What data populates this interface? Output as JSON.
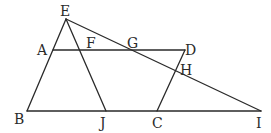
{
  "diagram": {
    "type": "geometry",
    "points": [
      {
        "id": "E",
        "label": "E"
      },
      {
        "id": "A",
        "label": "A"
      },
      {
        "id": "F",
        "label": "F"
      },
      {
        "id": "G",
        "label": "G"
      },
      {
        "id": "D",
        "label": "D"
      },
      {
        "id": "H",
        "label": "H"
      },
      {
        "id": "B",
        "label": "B"
      },
      {
        "id": "J",
        "label": "J"
      },
      {
        "id": "C",
        "label": "C"
      },
      {
        "id": "I",
        "label": "I"
      }
    ],
    "segments": [
      {
        "id": "EB",
        "from": "E",
        "to": "B"
      },
      {
        "id": "EJ",
        "from": "E",
        "to": "J"
      },
      {
        "id": "EI",
        "from": "E",
        "to": "I"
      },
      {
        "id": "AD",
        "from": "A",
        "to": "D"
      },
      {
        "id": "DC",
        "from": "D",
        "to": "C"
      },
      {
        "id": "BI",
        "from": "B",
        "to": "I"
      }
    ],
    "colors": {
      "stroke": "#2a2a2a",
      "background": "#ffffff"
    }
  }
}
